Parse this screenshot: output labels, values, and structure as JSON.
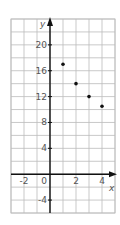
{
  "chart_data": {
    "type": "scatter",
    "title": "",
    "xlabel": "x",
    "ylabel": "y",
    "xlim": [
      -3,
      5
    ],
    "ylim": [
      -6,
      24
    ],
    "grid": true,
    "x_ticks": [
      -2,
      0,
      2,
      4
    ],
    "y_ticks": [
      -4,
      4,
      8,
      12,
      16,
      20
    ],
    "x_tick_labels": [
      "-2",
      "0",
      "2",
      "4"
    ],
    "y_tick_labels": [
      "-4",
      "4",
      "8",
      "12",
      "16",
      "20"
    ],
    "series": [
      {
        "name": "points",
        "x": [
          1,
          2,
          3,
          4
        ],
        "y": [
          17,
          14,
          12,
          10.5
        ]
      }
    ],
    "colors": {
      "grid": "#bbbbbb",
      "axis": "#111111",
      "point": "#111111",
      "label": "#555555"
    }
  }
}
